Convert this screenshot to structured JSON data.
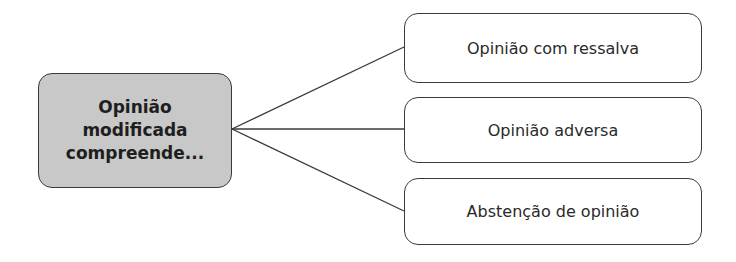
{
  "diagram": {
    "type": "tree",
    "root": {
      "lines": [
        "Opinião",
        "modificada",
        "compreende..."
      ],
      "fill": "#c8c8c8"
    },
    "children": [
      {
        "label": "Opinião com ressalva"
      },
      {
        "label": "Opinião adversa"
      },
      {
        "label": "Abstenção de opinião"
      }
    ],
    "colors": {
      "stroke": "#3a3a3a",
      "root_fill": "#c8c8c8",
      "child_fill": "#ffffff"
    }
  }
}
